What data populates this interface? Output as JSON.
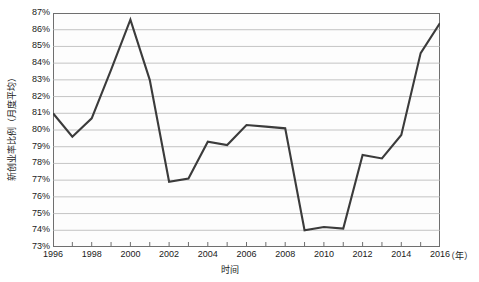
{
  "chart_data": {
    "type": "line",
    "title": "",
    "xlabel": "时间",
    "ylabel": "新创业率比例（月度平均）",
    "x_unit": "（年）",
    "categories": [
      1996,
      1997,
      1998,
      1999,
      2000,
      2001,
      2002,
      2003,
      2004,
      2005,
      2006,
      2007,
      2008,
      2009,
      2010,
      2011,
      2012,
      2013,
      2014,
      2015,
      2016
    ],
    "x": [
      1996,
      1997,
      1998,
      1999,
      2000,
      2001,
      2002,
      2003,
      2004,
      2005,
      2006,
      2007,
      2008,
      2009,
      2010,
      2011,
      2012,
      2013,
      2014,
      2015,
      2016
    ],
    "values": [
      81.0,
      79.6,
      80.7,
      83.6,
      86.6,
      83.0,
      76.9,
      77.1,
      79.3,
      79.1,
      80.3,
      80.2,
      80.1,
      74.0,
      74.2,
      74.1,
      78.5,
      78.3,
      79.7,
      84.6,
      86.4
    ],
    "series": [
      {
        "name": "新创业率比例（月度平均）",
        "color": "#3b3b3b",
        "values": [
          81.0,
          79.6,
          80.7,
          83.6,
          86.6,
          83.0,
          76.9,
          77.1,
          79.3,
          79.1,
          80.3,
          80.2,
          80.1,
          74.0,
          74.2,
          74.1,
          78.5,
          78.3,
          79.7,
          84.6,
          86.4
        ]
      }
    ],
    "ylim": [
      73,
      87
    ],
    "xlim": [
      1996,
      2016
    ],
    "y_tick_labels": [
      "87%",
      "86%",
      "85%",
      "84%",
      "83%",
      "82%",
      "81%",
      "80%",
      "79%",
      "78%",
      "77%",
      "76%",
      "75%",
      "74%",
      "73%"
    ],
    "y_tick_values": [
      87,
      86,
      85,
      84,
      83,
      82,
      81,
      80,
      79,
      78,
      77,
      76,
      75,
      74,
      73
    ],
    "x_tick_labels": [
      "1996",
      "1998",
      "2000",
      "2002",
      "2004",
      "2006",
      "2008",
      "2010",
      "2012",
      "2014",
      "2016"
    ],
    "x_tick_values": [
      1996,
      1998,
      2000,
      2002,
      2004,
      2006,
      2008,
      2010,
      2012,
      2014,
      2016
    ],
    "x_minor_tick_values": [
      1997,
      1999,
      2001,
      2003,
      2005,
      2007,
      2009,
      2011,
      2013,
      2015
    ],
    "grid": {
      "horizontal": true,
      "vertical": false,
      "color": "#b5b5b5"
    },
    "legend": {
      "visible": false,
      "position": "none"
    },
    "plot_background": "#fdfdfd",
    "border_color": "#6f6f6f",
    "line_width": 2.1,
    "markers": false
  }
}
